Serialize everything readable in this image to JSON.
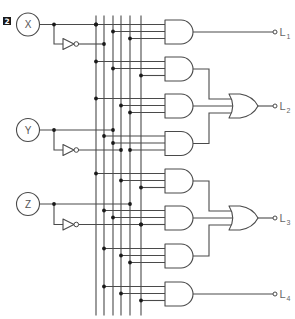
{
  "figure": {
    "number_badge": "2",
    "type": "combinational logic circuit"
  },
  "bus": {
    "signals": [
      "X",
      "X'",
      "Y",
      "Y'",
      "Z",
      "Z'"
    ]
  },
  "inputs": [
    {
      "label": "X",
      "signal": "X",
      "inverted": "X'"
    },
    {
      "label": "Y",
      "signal": "Y",
      "inverted": "Y'"
    },
    {
      "label": "Z",
      "signal": "Z",
      "inverted": "Z'"
    }
  ],
  "and_gates": [
    {
      "id": "A1",
      "inputs": [
        "X",
        "Y",
        "Z"
      ],
      "feeds": "L1"
    },
    {
      "id": "A2",
      "inputs": [
        "X",
        "Y",
        "Z'"
      ],
      "feeds": "OR1"
    },
    {
      "id": "A3",
      "inputs": [
        "X",
        "Y'",
        "Z"
      ],
      "feeds": "OR1"
    },
    {
      "id": "A4",
      "inputs": [
        "X'",
        "Y",
        "Z"
      ],
      "feeds": "OR1"
    },
    {
      "id": "A5",
      "inputs": [
        "X",
        "Y'",
        "Z'"
      ],
      "feeds": "OR2"
    },
    {
      "id": "A6",
      "inputs": [
        "X'",
        "Y",
        "Z'"
      ],
      "feeds": "OR2"
    },
    {
      "id": "A7",
      "inputs": [
        "X'",
        "Y'",
        "Z"
      ],
      "feeds": "OR2"
    },
    {
      "id": "A8",
      "inputs": [
        "X'",
        "Y'",
        "Z'"
      ],
      "feeds": "L4"
    }
  ],
  "or_gates": [
    {
      "id": "OR1",
      "inputs": [
        "A2",
        "A3",
        "A4"
      ],
      "feeds": "L2"
    },
    {
      "id": "OR2",
      "inputs": [
        "A5",
        "A6",
        "A7"
      ],
      "feeds": "L3"
    }
  ],
  "outputs": [
    {
      "id": "L1",
      "label": "L",
      "subscript": "1",
      "source": "A1"
    },
    {
      "id": "L2",
      "label": "L",
      "subscript": "2",
      "source": "OR1"
    },
    {
      "id": "L3",
      "label": "L",
      "subscript": "3",
      "source": "OR2"
    },
    {
      "id": "L4",
      "label": "L",
      "subscript": "4",
      "source": "A8"
    }
  ],
  "colors": {
    "wire": "#4a4a4a",
    "junction": "#1a1a1a",
    "badge_bg": "#1a1a1a",
    "badge_text": "#ffffff",
    "label": "#666666"
  }
}
